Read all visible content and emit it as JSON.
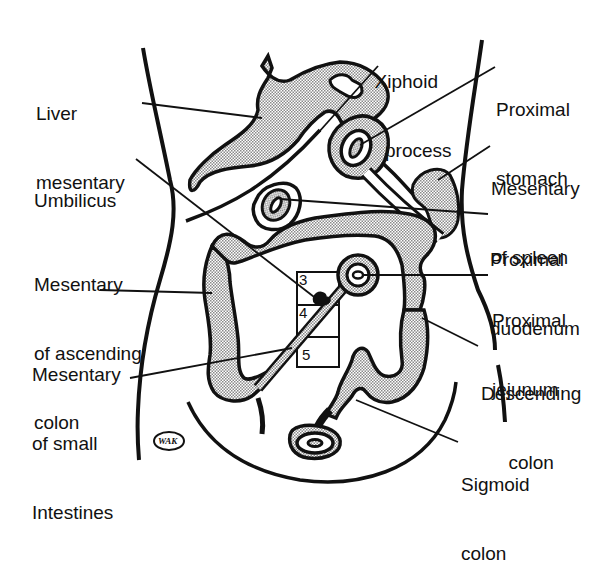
{
  "diagram": {
    "colors": {
      "ink": "#111111",
      "mesentery_fill": "#cfcfcf",
      "background": "#ffffff"
    },
    "labels": {
      "liver_mesentary": [
        "Liver",
        "mesentary"
      ],
      "xiphoid_process": [
        "Xiphoid",
        "process"
      ],
      "proximal_stomach": [
        "Proximal",
        "stomach"
      ],
      "umbilicus": [
        "Umbilicus"
      ],
      "mesentary_of_spleen": [
        "Mesentary",
        "of spleen"
      ],
      "proximal_duodenum": [
        "Proximal",
        "duodenum"
      ],
      "mesentary_of_ascending_colon": [
        "Mesentary",
        "of ascending",
        "colon"
      ],
      "proximal_jejunum": [
        "Proximal",
        "jejunum"
      ],
      "mesentary_of_small_intestines": [
        "Mesentary",
        "of small",
        "Intestines"
      ],
      "descending_colon": [
        "Descending",
        "colon"
      ],
      "sigmoid_colon": [
        "Sigmoid",
        "colon"
      ]
    },
    "grid_numbers": [
      "3",
      "4",
      "5"
    ],
    "logo": "WAK"
  }
}
